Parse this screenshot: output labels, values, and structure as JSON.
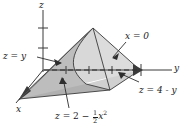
{
  "figure": {
    "type": "3d-solid-diagram",
    "axes": {
      "x_label": "x",
      "y_label": "y",
      "z_label": "z"
    },
    "labels": {
      "plane_z_equals_y": "z = y",
      "plane_x_equals_0": "x = 0",
      "plane_z_equals_4_minus_y": "z = 4 - y",
      "surface_z_equals_2_minus_half_x_squared": {
        "lhs": "z",
        "eq": "=",
        "const": "2",
        "minus": "−",
        "frac_num": "1",
        "frac_den": "2",
        "var": "x",
        "exp": "2"
      }
    },
    "colors": {
      "fill_light": "#d9d9d9",
      "fill_mid": "#c4c4c4",
      "fill_dark": "#a8a8a8",
      "stroke": "#3a3a3a",
      "text": "#1a1a1a"
    },
    "tick_counts": {
      "z_axis_ticks": 2,
      "y_axis_ticks": 4
    }
  }
}
